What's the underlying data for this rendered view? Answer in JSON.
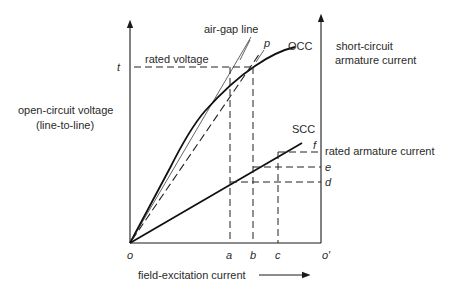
{
  "diagram": {
    "left_axis_label_line1": "open-circuit voltage",
    "left_axis_label_line2": "(line-to-line)",
    "right_axis_label_line1": "short-circuit",
    "right_axis_label_line2": "armature current",
    "x_axis_label": "field-excitation current",
    "curves": {
      "air_gap_line": "air-gap line",
      "occ": "OCC",
      "scc": "SCC"
    },
    "annotations": {
      "rated_voltage": "rated voltage",
      "rated_armature_current": "rated armature current"
    },
    "points": {
      "origin": "o",
      "origin_prime": "o′",
      "a": "a",
      "b": "b",
      "c": "c",
      "t": "t",
      "p": "p",
      "d": "d",
      "e": "e",
      "f": "f"
    }
  }
}
